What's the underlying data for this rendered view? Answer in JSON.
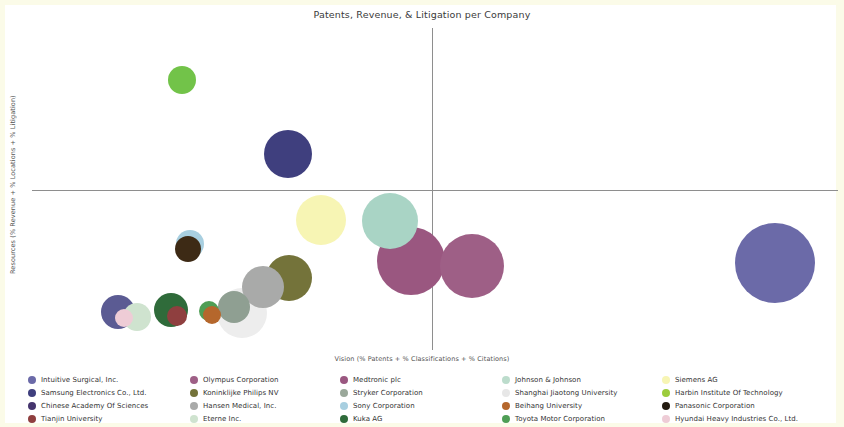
{
  "chart_data": {
    "type": "scatter",
    "title": "Patents, Revenue, & Litigation per Company",
    "xlabel": "Vision (% Patents + % Classifications + % Citations)",
    "ylabel": "Resources (% Revenue + % Locations + % Litigation)",
    "grid": false,
    "legend_position": "bottom",
    "axis_origin_lines": true,
    "xlim": [
      0,
      100
    ],
    "ylim": [
      0,
      100
    ],
    "points": [
      {
        "name": "Intuitive Surgical, Inc.",
        "color": "#6b6aa8",
        "cx": 92.2,
        "cy": 27.0,
        "r": 40
      },
      {
        "name": "Samsung Electronics Co., Ltd.",
        "color": "#3f3f7e",
        "cx": 31.8,
        "cy": 60.8,
        "r": 24
      },
      {
        "name": "Chinese Academy Of Sciences",
        "color": "#5b5b93",
        "cx": 10.7,
        "cy": 11.7,
        "r": 17
      },
      {
        "name": "Tianjin University",
        "color": "#8f3f3f",
        "cx": 18.0,
        "cy": 10.5,
        "r": 10
      },
      {
        "name": "Olympus Corporation",
        "color": "#9e5f86",
        "cx": 54.6,
        "cy": 26.1,
        "r": 32
      },
      {
        "name": "Koninklijke Philips NV",
        "color": "#74733a",
        "cx": 31.9,
        "cy": 22.5,
        "r": 23
      },
      {
        "name": "Hansen Medical, Inc.",
        "color": "#a9aaa9",
        "cx": 28.6,
        "cy": 19.6,
        "r": 21
      },
      {
        "name": "Eterne Inc.",
        "color": "#cfe3cf",
        "cx": 13.0,
        "cy": 10.2,
        "r": 14
      },
      {
        "name": "Medtronic plc",
        "color": "#9a5780",
        "cx": 47.0,
        "cy": 27.5,
        "r": 34
      },
      {
        "name": "Stryker Corporation",
        "color": "#8f9f92",
        "cx": 25.0,
        "cy": 13.5,
        "r": 16
      },
      {
        "name": "Sony Corporation",
        "color": "#a8cfe0",
        "cx": 19.6,
        "cy": 33.0,
        "r": 14
      },
      {
        "name": "Kuka AG",
        "color": "#2f6b3a",
        "cx": 17.3,
        "cy": 12.5,
        "r": 17
      },
      {
        "name": "Johnson & Johnson",
        "color": "#a9d4c5",
        "cx": 44.4,
        "cy": 40.0,
        "r": 28
      },
      {
        "name": "Shanghai Jiaotong University",
        "color": "#ededed",
        "cx": 26.0,
        "cy": 11.5,
        "r": 25
      },
      {
        "name": "Beihang University",
        "color": "#b5672c",
        "cx": 22.3,
        "cy": 11.0,
        "r": 9
      },
      {
        "name": "Toyota Motor Corporation",
        "color": "#4f9e55",
        "cx": 22.0,
        "cy": 12.0,
        "r": 10
      },
      {
        "name": "Siemens AG",
        "color": "#f7f5b4",
        "cx": 35.8,
        "cy": 40.4,
        "r": 25
      },
      {
        "name": "Harbin Institute Of Technology",
        "color": "#72c349",
        "cx": 18.6,
        "cy": 83.8,
        "r": 14
      },
      {
        "name": "Panasonic Corporation",
        "color": "#3d2a15",
        "cx": 19.4,
        "cy": 31.5,
        "r": 13
      },
      {
        "name": "Hyundai Heavy Industries Co., Ltd.",
        "color": "#eeccd6",
        "cx": 11.4,
        "cy": 10.0,
        "r": 9
      }
    ],
    "legend_columns": [
      [
        {
          "label": "Intuitive Surgical, Inc.",
          "color": "#6b6aa8"
        },
        {
          "label": "Samsung Electronics Co., Ltd.",
          "color": "#3f3f7e"
        },
        {
          "label": "Chinese Academy Of Sciences",
          "color": "#45356e"
        },
        {
          "label": "Tianjin University",
          "color": "#8f3f3f"
        }
      ],
      [
        {
          "label": "Olympus Corporation",
          "color": "#9e5f86"
        },
        {
          "label": "Koninklijke Philips NV",
          "color": "#74733a"
        },
        {
          "label": "Hansen Medical, Inc.",
          "color": "#a9aaa9"
        },
        {
          "label": "Eterne Inc.",
          "color": "#cfe3cf"
        }
      ],
      [
        {
          "label": "Medtronic plc",
          "color": "#9a5780"
        },
        {
          "label": "Stryker Corporation",
          "color": "#9aa89a"
        },
        {
          "label": "Sony Corporation",
          "color": "#a8cfe0"
        },
        {
          "label": "Kuka AG",
          "color": "#2f6b3a"
        }
      ],
      [
        {
          "label": "Johnson & Johnson",
          "color": "#bcdccc"
        },
        {
          "label": "Shanghai Jiaotong University",
          "color": "#e7e7e7"
        },
        {
          "label": "Beihang University",
          "color": "#b5672c"
        },
        {
          "label": "Toyota Motor Corporation",
          "color": "#4f9e55"
        }
      ],
      [
        {
          "label": "Siemens AG",
          "color": "#f7f5b4"
        },
        {
          "label": "Harbin Institute Of Technology",
          "color": "#9ccc3c"
        },
        {
          "label": "Panasonic Corporation",
          "color": "#231b10"
        },
        {
          "label": "Hyundai Heavy Industries Co., Ltd.",
          "color": "#eeccd6"
        }
      ]
    ]
  }
}
